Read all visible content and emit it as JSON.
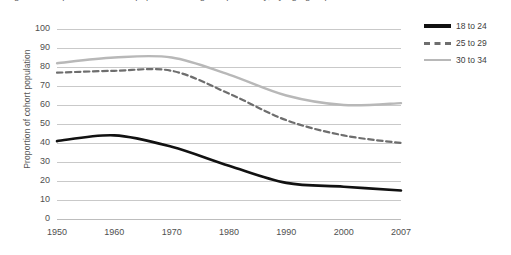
{
  "title_partial": "Figure 1. Proportion of cohort population living independently, by age group",
  "y_axis_title": "Proportion of cohort population",
  "legend": {
    "items": [
      {
        "label": "18 to 24",
        "color": "#111111",
        "style": "solid"
      },
      {
        "label": "25 to 29",
        "color": "#6e6e6e",
        "style": "dashed"
      },
      {
        "label": "30 to 34",
        "color": "#b8b8b8",
        "style": "solid"
      }
    ]
  },
  "chart_data": {
    "type": "line",
    "title": "",
    "xlabel": "",
    "ylabel": "Proportion of cohort population",
    "x": [
      "1950",
      "1960",
      "1970",
      "1980",
      "1990",
      "2000",
      "2007"
    ],
    "categories": [
      "1950",
      "1960",
      "1970",
      "1980",
      "1990",
      "2000",
      "2007"
    ],
    "ylim": [
      0,
      100
    ],
    "yticks": [
      0,
      10,
      20,
      30,
      40,
      50,
      60,
      70,
      80,
      90,
      100
    ],
    "grid": true,
    "legend_position": "right",
    "series": [
      {
        "name": "18 to 24",
        "color": "#111111",
        "style": "solid",
        "values": [
          41,
          44,
          38,
          28,
          19,
          17,
          15
        ]
      },
      {
        "name": "25 to 29",
        "color": "#6e6e6e",
        "style": "dashed",
        "values": [
          77,
          78,
          78,
          66,
          52,
          44,
          40
        ]
      },
      {
        "name": "30 to 34",
        "color": "#b8b8b8",
        "style": "solid",
        "values": [
          82,
          85,
          85,
          76,
          65,
          60,
          61
        ]
      }
    ]
  }
}
